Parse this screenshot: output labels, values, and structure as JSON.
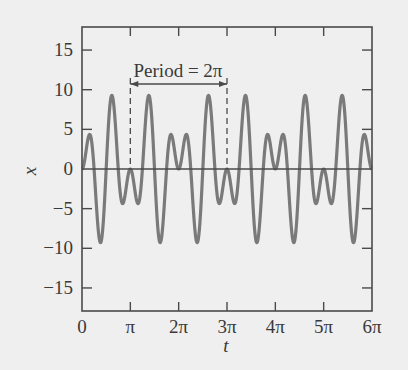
{
  "chart_data": {
    "type": "line",
    "title": "",
    "xlabel": "t",
    "ylabel": "x",
    "xlim": [
      0,
      18.8496
    ],
    "ylim": [
      -18,
      18
    ],
    "x_ticks": [
      {
        "value": 0,
        "label": "0"
      },
      {
        "value": 3.14159,
        "label": "π"
      },
      {
        "value": 6.28319,
        "label": "2π"
      },
      {
        "value": 9.42478,
        "label": "3π"
      },
      {
        "value": 12.56637,
        "label": "4π"
      },
      {
        "value": 15.70796,
        "label": "5π"
      },
      {
        "value": 18.84956,
        "label": "6π"
      }
    ],
    "y_ticks": [
      {
        "value": 15,
        "label": "15"
      },
      {
        "value": 10,
        "label": "10"
      },
      {
        "value": 5,
        "label": "5"
      },
      {
        "value": 0,
        "label": "0"
      },
      {
        "value": -5,
        "label": "−5"
      },
      {
        "value": -10,
        "label": "−10"
      },
      {
        "value": -15,
        "label": "−15"
      }
    ],
    "grid": false,
    "legend": null,
    "series": [
      {
        "name": "x(t)",
        "model": "x(t) ≈ 10·sin(t)·sin(4t)",
        "amplitude": 10,
        "color": "#7a7a7a",
        "key_points": [
          {
            "t_over_pi": 0.0,
            "x": 0
          },
          {
            "t_over_pi": 0.12,
            "x": 4.3
          },
          {
            "t_over_pi": 0.37,
            "x": -9.3
          },
          {
            "t_over_pi": 0.6,
            "x": 9.3
          },
          {
            "t_over_pi": 0.85,
            "x": -4.3
          },
          {
            "t_over_pi": 1.0,
            "x": 0
          },
          {
            "t_over_pi": 1.15,
            "x": -4.3
          },
          {
            "t_over_pi": 1.4,
            "x": 9.3
          },
          {
            "t_over_pi": 1.63,
            "x": -9.3
          },
          {
            "t_over_pi": 1.88,
            "x": 4.3
          },
          {
            "t_over_pi": 2.0,
            "x": 0
          }
        ]
      }
    ],
    "annotations": [
      {
        "text": "Period = 2π",
        "type": "double-arrow",
        "from_t": 3.14159,
        "to_t": 9.42478,
        "y_value": 10.8,
        "dashed_markers_at": [
          3.14159,
          9.42478
        ]
      }
    ]
  },
  "colors": {
    "background": "#efefef",
    "axis": "#4a4a4a",
    "curve": "#7a7a7a",
    "text": "#3a3a3a"
  }
}
